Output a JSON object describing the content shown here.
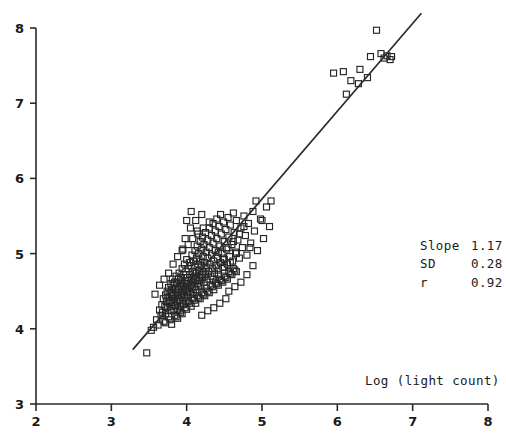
{
  "figure": {
    "width": 506,
    "height": 446,
    "background": "#ffffff",
    "foreground": "#262626"
  },
  "annotations": {
    "slope_label": "Slope",
    "slope_value": "1.17",
    "sd_label": "SD",
    "sd_value": "0.28",
    "r_label": "r",
    "r_value": "0.92"
  },
  "chart_data": {
    "type": "scatter",
    "title": "",
    "subtitle": "",
    "xlabel": "Log (light count)",
    "ylabel": "",
    "xlim": [
      2,
      8
    ],
    "ylim": [
      3,
      8
    ],
    "xticks": [
      2,
      3,
      4,
      5,
      6,
      7,
      8
    ],
    "xticklabels": [
      "2",
      "3",
      "4",
      "5",
      "6",
      "7",
      "8"
    ],
    "yticks": [
      3,
      4,
      5,
      6,
      7,
      8
    ],
    "yticklabels": [
      "3",
      "4",
      "5",
      "6",
      "7",
      "8"
    ],
    "grid": false,
    "legend": null,
    "marker": "open-square",
    "marker_size_px": 6,
    "annotations": [
      {
        "text": "Slope 1.17",
        "x": 6.1,
        "y": 5.25
      },
      {
        "text": "SD    0.28",
        "x": 6.1,
        "y": 5.0
      },
      {
        "text": "r     0.92",
        "x": 6.1,
        "y": 4.75
      },
      {
        "text": "Log (light count)",
        "x": 6.3,
        "y": 3.35
      }
    ],
    "fit_line": {
      "type": "linear-regression",
      "slope": 1.17,
      "sd": 0.28,
      "r": 0.92,
      "x_start": 3.29,
      "y_start": 3.73,
      "x_end": 7.11,
      "y_end": 8.19
    },
    "series": [
      {
        "name": "observations",
        "n": 268,
        "points": [
          [
            3.47,
            3.68
          ],
          [
            3.53,
            3.98
          ],
          [
            3.56,
            4.02
          ],
          [
            3.6,
            4.12
          ],
          [
            3.62,
            4.05
          ],
          [
            3.64,
            4.25
          ],
          [
            3.66,
            4.18
          ],
          [
            3.67,
            4.32
          ],
          [
            3.68,
            4.22
          ],
          [
            3.69,
            4.4
          ],
          [
            3.7,
            4.1
          ],
          [
            3.71,
            4.3
          ],
          [
            3.72,
            4.45
          ],
          [
            3.72,
            4.2
          ],
          [
            3.73,
            4.36
          ],
          [
            3.74,
            4.5
          ],
          [
            3.74,
            4.28
          ],
          [
            3.75,
            4.42
          ],
          [
            3.76,
            4.16
          ],
          [
            3.76,
            4.55
          ],
          [
            3.77,
            4.34
          ],
          [
            3.78,
            4.48
          ],
          [
            3.78,
            4.25
          ],
          [
            3.79,
            4.6
          ],
          [
            3.79,
            4.38
          ],
          [
            3.8,
            4.52
          ],
          [
            3.8,
            4.3
          ],
          [
            3.81,
            4.44
          ],
          [
            3.81,
            4.66
          ],
          [
            3.82,
            4.35
          ],
          [
            3.82,
            4.58
          ],
          [
            3.83,
            4.46
          ],
          [
            3.83,
            4.24
          ],
          [
            3.84,
            4.62
          ],
          [
            3.84,
            4.4
          ],
          [
            3.85,
            4.54
          ],
          [
            3.85,
            4.31
          ],
          [
            3.86,
            4.7
          ],
          [
            3.86,
            4.48
          ],
          [
            3.87,
            4.36
          ],
          [
            3.87,
            4.6
          ],
          [
            3.88,
            4.44
          ],
          [
            3.88,
            4.26
          ],
          [
            3.89,
            4.66
          ],
          [
            3.89,
            4.52
          ],
          [
            3.9,
            4.38
          ],
          [
            3.9,
            4.74
          ],
          [
            3.91,
            4.56
          ],
          [
            3.91,
            4.42
          ],
          [
            3.92,
            4.68
          ],
          [
            3.92,
            4.3
          ],
          [
            3.93,
            4.58
          ],
          [
            3.93,
            4.46
          ],
          [
            3.94,
            4.8
          ],
          [
            3.94,
            4.62
          ],
          [
            3.95,
            4.5
          ],
          [
            3.95,
            4.34
          ],
          [
            3.96,
            4.72
          ],
          [
            3.96,
            4.56
          ],
          [
            3.97,
            4.44
          ],
          [
            3.97,
            4.86
          ],
          [
            3.98,
            4.64
          ],
          [
            3.98,
            4.52
          ],
          [
            3.99,
            4.38
          ],
          [
            3.99,
            4.76
          ],
          [
            4.0,
            4.6
          ],
          [
            4.0,
            4.48
          ],
          [
            4.0,
            4.92
          ],
          [
            4.01,
            4.68
          ],
          [
            4.01,
            4.54
          ],
          [
            4.02,
            4.42
          ],
          [
            4.02,
            4.8
          ],
          [
            4.03,
            4.64
          ],
          [
            4.03,
            4.5
          ],
          [
            4.04,
            4.88
          ],
          [
            4.04,
            4.72
          ],
          [
            4.05,
            4.58
          ],
          [
            4.05,
            4.46
          ],
          [
            4.06,
            4.84
          ],
          [
            4.06,
            4.66
          ],
          [
            4.07,
            4.54
          ],
          [
            4.07,
            4.98
          ],
          [
            4.08,
            4.76
          ],
          [
            4.08,
            4.62
          ],
          [
            4.09,
            4.48
          ],
          [
            4.09,
            4.9
          ],
          [
            4.1,
            4.7
          ],
          [
            4.1,
            4.56
          ],
          [
            4.11,
            5.04
          ],
          [
            4.11,
            4.82
          ],
          [
            4.12,
            4.66
          ],
          [
            4.12,
            4.52
          ],
          [
            4.13,
            4.94
          ],
          [
            4.13,
            4.74
          ],
          [
            4.14,
            4.6
          ],
          [
            4.14,
            5.1
          ],
          [
            4.15,
            4.86
          ],
          [
            4.15,
            4.68
          ],
          [
            4.16,
            4.56
          ],
          [
            4.16,
            5.0
          ],
          [
            4.17,
            4.78
          ],
          [
            4.17,
            4.64
          ],
          [
            4.18,
            5.16
          ],
          [
            4.18,
            4.9
          ],
          [
            4.19,
            4.72
          ],
          [
            4.19,
            4.58
          ],
          [
            4.2,
            5.06
          ],
          [
            4.2,
            4.84
          ],
          [
            4.21,
            4.68
          ],
          [
            4.21,
            5.22
          ],
          [
            4.22,
            4.96
          ],
          [
            4.22,
            4.76
          ],
          [
            4.23,
            4.62
          ],
          [
            4.23,
            5.12
          ],
          [
            4.24,
            4.88
          ],
          [
            4.25,
            4.72
          ],
          [
            4.25,
            5.28
          ],
          [
            4.26,
            5.02
          ],
          [
            4.26,
            4.82
          ],
          [
            4.27,
            4.66
          ],
          [
            4.28,
            5.18
          ],
          [
            4.28,
            4.94
          ],
          [
            4.29,
            4.76
          ],
          [
            4.3,
            5.34
          ],
          [
            4.3,
            5.08
          ],
          [
            4.31,
            4.86
          ],
          [
            4.32,
            4.7
          ],
          [
            4.33,
            5.24
          ],
          [
            4.33,
            4.98
          ],
          [
            4.34,
            4.8
          ],
          [
            4.35,
            5.4
          ],
          [
            4.35,
            5.14
          ],
          [
            4.36,
            4.9
          ],
          [
            4.37,
            4.74
          ],
          [
            4.38,
            5.3
          ],
          [
            4.38,
            5.04
          ],
          [
            4.39,
            4.84
          ],
          [
            4.4,
            5.46
          ],
          [
            4.4,
            5.2
          ],
          [
            4.41,
            4.94
          ],
          [
            4.42,
            4.78
          ],
          [
            4.43,
            5.36
          ],
          [
            4.44,
            5.1
          ],
          [
            4.45,
            4.88
          ],
          [
            4.45,
            5.52
          ],
          [
            4.46,
            5.26
          ],
          [
            4.47,
            5.0
          ],
          [
            4.48,
            4.82
          ],
          [
            4.49,
            5.42
          ],
          [
            4.5,
            5.16
          ],
          [
            4.5,
            4.92
          ],
          [
            4.52,
            5.32
          ],
          [
            4.53,
            5.06
          ],
          [
            4.54,
            4.86
          ],
          [
            4.55,
            5.48
          ],
          [
            4.56,
            5.22
          ],
          [
            4.57,
            4.96
          ],
          [
            4.58,
            5.38
          ],
          [
            4.6,
            5.12
          ],
          [
            4.61,
            4.9
          ],
          [
            4.62,
            5.54
          ],
          [
            4.63,
            5.28
          ],
          [
            4.65,
            5.02
          ],
          [
            4.66,
            5.44
          ],
          [
            4.68,
            5.18
          ],
          [
            4.7,
            4.94
          ],
          [
            4.72,
            5.34
          ],
          [
            4.74,
            5.08
          ],
          [
            4.76,
            5.5
          ],
          [
            4.78,
            5.24
          ],
          [
            4.8,
            4.98
          ],
          [
            4.82,
            5.4
          ],
          [
            4.85,
            5.14
          ],
          [
            4.88,
            5.56
          ],
          [
            4.9,
            5.3
          ],
          [
            4.94,
            5.04
          ],
          [
            4.98,
            5.46
          ],
          [
            5.02,
            5.2
          ],
          [
            5.06,
            5.62
          ],
          [
            5.1,
            5.36
          ],
          [
            3.72,
            4.08
          ],
          [
            3.84,
            4.18
          ],
          [
            3.9,
            4.24
          ],
          [
            3.96,
            4.32
          ],
          [
            4.02,
            4.36
          ],
          [
            4.08,
            4.4
          ],
          [
            4.14,
            4.44
          ],
          [
            4.2,
            4.48
          ],
          [
            4.26,
            4.54
          ],
          [
            4.32,
            4.58
          ],
          [
            4.38,
            4.62
          ],
          [
            4.44,
            4.66
          ],
          [
            4.5,
            4.7
          ],
          [
            4.56,
            4.76
          ],
          [
            4.62,
            4.8
          ],
          [
            3.78,
            4.12
          ],
          [
            3.86,
            4.16
          ],
          [
            3.92,
            4.22
          ],
          [
            3.98,
            4.28
          ],
          [
            4.04,
            4.34
          ],
          [
            4.1,
            4.38
          ],
          [
            4.16,
            4.42
          ],
          [
            4.22,
            4.46
          ],
          [
            4.28,
            4.5
          ],
          [
            4.34,
            4.56
          ],
          [
            4.4,
            4.6
          ],
          [
            4.46,
            4.64
          ],
          [
            4.52,
            4.68
          ],
          [
            4.58,
            4.74
          ],
          [
            4.64,
            4.78
          ],
          [
            3.8,
            4.06
          ],
          [
            3.88,
            4.14
          ],
          [
            3.94,
            4.2
          ],
          [
            4.0,
            4.26
          ],
          [
            4.06,
            4.3
          ],
          [
            4.12,
            4.34
          ],
          [
            4.18,
            4.4
          ],
          [
            4.24,
            4.44
          ],
          [
            4.3,
            4.48
          ],
          [
            4.36,
            4.52
          ],
          [
            4.42,
            4.58
          ],
          [
            4.48,
            4.62
          ],
          [
            4.54,
            4.66
          ],
          [
            4.6,
            4.72
          ],
          [
            4.66,
            4.76
          ],
          [
            3.95,
            5.06
          ],
          [
            4.02,
            5.12
          ],
          [
            4.08,
            5.2
          ],
          [
            4.15,
            5.26
          ],
          [
            4.22,
            5.34
          ],
          [
            4.3,
            5.42
          ],
          [
            4.05,
            5.34
          ],
          [
            4.12,
            5.44
          ],
          [
            4.2,
            5.52
          ],
          [
            3.98,
            5.2
          ],
          [
            4.42,
            5.02
          ],
          [
            4.48,
            4.94
          ],
          [
            4.55,
            5.08
          ],
          [
            4.62,
            5.16
          ],
          [
            4.7,
            5.26
          ],
          [
            4.35,
            4.66
          ],
          [
            4.42,
            4.72
          ],
          [
            4.5,
            4.82
          ],
          [
            4.58,
            4.88
          ],
          [
            4.66,
            5.0
          ],
          [
            4.72,
            4.62
          ],
          [
            4.8,
            4.72
          ],
          [
            4.88,
            4.84
          ],
          [
            4.56,
            4.5
          ],
          [
            4.64,
            4.56
          ],
          [
            4.36,
            4.28
          ],
          [
            4.44,
            4.34
          ],
          [
            4.52,
            4.4
          ],
          [
            4.28,
            4.24
          ],
          [
            4.2,
            4.18
          ],
          [
            4.76,
            5.36
          ],
          [
            4.84,
            5.08
          ],
          [
            4.92,
            5.7
          ],
          [
            5.0,
            5.44
          ],
          [
            5.12,
            5.7
          ],
          [
            3.58,
            4.46
          ],
          [
            3.64,
            4.58
          ],
          [
            3.7,
            4.66
          ],
          [
            3.76,
            4.74
          ],
          [
            3.82,
            4.86
          ],
          [
            3.88,
            4.96
          ],
          [
            3.94,
            5.04
          ],
          [
            4.0,
            5.44
          ],
          [
            4.06,
            5.56
          ],
          [
            4.14,
            5.3
          ],
          [
            5.95,
            7.4
          ],
          [
            6.08,
            7.42
          ],
          [
            6.44,
            7.62
          ],
          [
            6.52,
            7.97
          ],
          [
            6.58,
            7.66
          ],
          [
            6.62,
            7.6
          ],
          [
            6.66,
            7.63
          ],
          [
            6.7,
            7.58
          ],
          [
            6.72,
            7.62
          ],
          [
            6.12,
            7.12
          ],
          [
            6.28,
            7.26
          ],
          [
            6.4,
            7.34
          ],
          [
            6.3,
            7.45
          ],
          [
            6.18,
            7.3
          ]
        ]
      }
    ]
  }
}
